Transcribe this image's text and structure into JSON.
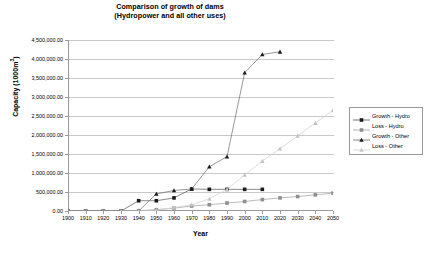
{
  "chart_data": {
    "type": "line",
    "title": "Comparison of growth of dams",
    "subtitle": "(Hydropower and all other uses)",
    "xlabel": "Year",
    "ylabel": "Capacity (1000m",
    "ylabel_sup": "3",
    "ylabel_tail": ")",
    "xlim": [
      1900,
      2050
    ],
    "ylim": [
      0,
      4500000
    ],
    "grid": true,
    "legend_position": "right",
    "x": [
      1900,
      1910,
      1920,
      1930,
      1940,
      1950,
      1960,
      1970,
      1980,
      1990,
      2000,
      2010,
      2020,
      2030,
      2040,
      2050
    ],
    "xtick_labels": [
      "1900",
      "1910",
      "1920",
      "1930",
      "1940",
      "1950",
      "1960",
      "1970",
      "1980",
      "1990",
      "2000",
      "2010",
      "2020",
      "2030",
      "2040",
      "2050"
    ],
    "ytick_labels": [
      "4,500,000.00",
      "4,000,000.00",
      "3,500,000.00",
      "3,000,000.00",
      "2,500,000.00",
      "2,000,000.00",
      "1,500,000.00",
      "1,000,000.00",
      "500,000.00",
      "0.00"
    ],
    "ytick_values": [
      4500000,
      4000000,
      3500000,
      3000000,
      2500000,
      2000000,
      1500000,
      1000000,
      500000,
      0
    ],
    "series": [
      {
        "name": "Growth - Hydro",
        "marker": "square",
        "color": "#1a1a1a",
        "line_color": "#555555",
        "points": [
          {
            "x": 1900,
            "y": 0
          },
          {
            "x": 1910,
            "y": 0
          },
          {
            "x": 1920,
            "y": 0
          },
          {
            "x": 1930,
            "y": 0
          },
          {
            "x": 1940,
            "y": 270000
          },
          {
            "x": 1950,
            "y": 270000
          },
          {
            "x": 1960,
            "y": 345000
          },
          {
            "x": 1970,
            "y": 580000
          },
          {
            "x": 1980,
            "y": 570000
          },
          {
            "x": 1990,
            "y": 570000
          },
          {
            "x": 2000,
            "y": 570000
          },
          {
            "x": 2010,
            "y": 570000
          }
        ]
      },
      {
        "name": "Loss - Hydro",
        "marker": "square",
        "color": "#8f8f8f",
        "line_color": "#9e9e9e",
        "points": [
          {
            "x": 1900,
            "y": 0
          },
          {
            "x": 1910,
            "y": 0
          },
          {
            "x": 1920,
            "y": 0
          },
          {
            "x": 1930,
            "y": 0
          },
          {
            "x": 1940,
            "y": 8000
          },
          {
            "x": 1950,
            "y": 35000
          },
          {
            "x": 1960,
            "y": 75000
          },
          {
            "x": 1970,
            "y": 130000
          },
          {
            "x": 1980,
            "y": 165000
          },
          {
            "x": 1990,
            "y": 210000
          },
          {
            "x": 2000,
            "y": 250000
          },
          {
            "x": 2010,
            "y": 300000
          },
          {
            "x": 2020,
            "y": 345000
          },
          {
            "x": 2030,
            "y": 380000
          },
          {
            "x": 2040,
            "y": 425000
          },
          {
            "x": 2050,
            "y": 470000
          }
        ]
      },
      {
        "name": "Growth - Other",
        "marker": "triangle",
        "color": "#1a1a1a",
        "line_color": "#6b6b6b",
        "points": [
          {
            "x": 1930,
            "y": 0
          },
          {
            "x": 1940,
            "y": 0
          },
          {
            "x": 1950,
            "y": 450000
          },
          {
            "x": 1960,
            "y": 540000
          },
          {
            "x": 1970,
            "y": 580000
          },
          {
            "x": 1980,
            "y": 1165000
          },
          {
            "x": 1990,
            "y": 1430000
          },
          {
            "x": 2000,
            "y": 3640000
          },
          {
            "x": 2010,
            "y": 4120000
          },
          {
            "x": 2020,
            "y": 4190000
          }
        ]
      },
      {
        "name": "Loss - Other",
        "marker": "triangle",
        "color": "#c4c4c4",
        "line_color": "#cfcfcf",
        "points": [
          {
            "x": 1930,
            "y": 0
          },
          {
            "x": 1940,
            "y": 0
          },
          {
            "x": 1950,
            "y": 20000
          },
          {
            "x": 1960,
            "y": 90000
          },
          {
            "x": 1970,
            "y": 165000
          },
          {
            "x": 1980,
            "y": 320000
          },
          {
            "x": 1990,
            "y": 570000
          },
          {
            "x": 2000,
            "y": 950000
          },
          {
            "x": 2010,
            "y": 1315000
          },
          {
            "x": 2020,
            "y": 1640000
          },
          {
            "x": 2030,
            "y": 1980000
          },
          {
            "x": 2040,
            "y": 2315000
          },
          {
            "x": 2050,
            "y": 2650000
          }
        ]
      }
    ]
  },
  "legend": {
    "items": [
      {
        "label": "Growth - Hydro"
      },
      {
        "label": "Loss - Hydro"
      },
      {
        "label": "Growth - Other"
      },
      {
        "label": "Loss - Other"
      }
    ]
  }
}
